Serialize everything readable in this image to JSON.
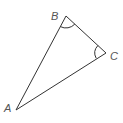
{
  "diagram": {
    "type": "triangle",
    "stroke_color": "#333333",
    "label_color": "#555555",
    "vertices": [
      {
        "label": "A",
        "x": 16,
        "y": 110
      },
      {
        "label": "B",
        "x": 66,
        "y": 16
      },
      {
        "label": "C",
        "x": 106,
        "y": 53
      }
    ],
    "angle_marks": [
      "B",
      "C"
    ],
    "labels": {
      "A": "A",
      "B": "B",
      "C": "C"
    }
  }
}
